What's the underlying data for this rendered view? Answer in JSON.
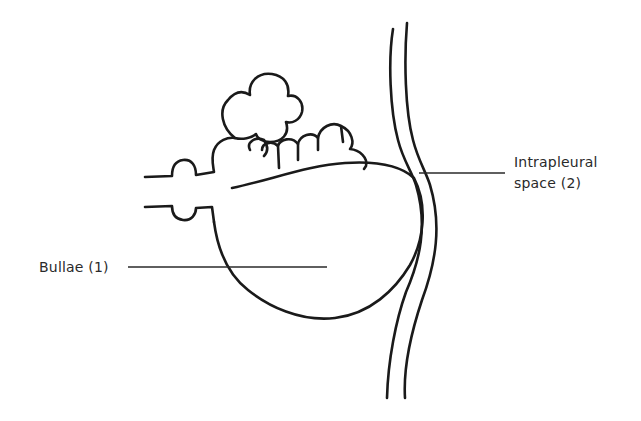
{
  "diagram": {
    "labels": [
      {
        "id": "bullae",
        "text": "Bullae (1)"
      },
      {
        "id": "intrapleural",
        "lines": [
          "Intrapleural",
          "space (2)"
        ]
      }
    ],
    "colors": {
      "ink": "#1a1a1a",
      "text": "#2a2a2a",
      "background": "#ffffff"
    }
  }
}
